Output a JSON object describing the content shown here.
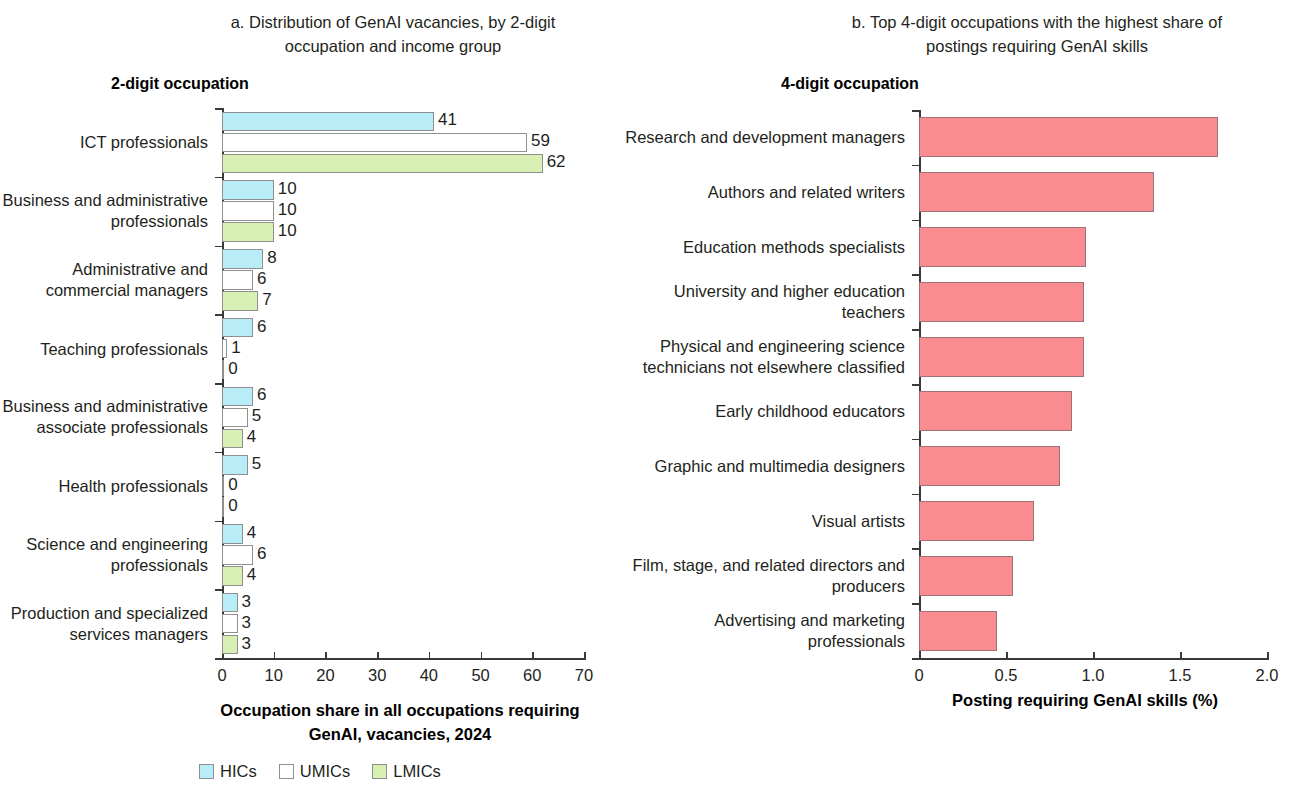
{
  "panel_a": {
    "title": "a. Distribution of GenAI vacancies, by 2-digit occupation and income group",
    "axis_header": "2-digit occupation",
    "xlabel": "Occupation share in all occupations requiring GenAI, vacancies, 2024",
    "legend": [
      {
        "key": "HICs",
        "label": "HICs",
        "color": "#b8ecf6"
      },
      {
        "key": "UMICs",
        "label": "UMICs",
        "color": "#ffffff"
      },
      {
        "key": "LMICs",
        "label": "LMICs",
        "color": "#d9f0b4"
      }
    ]
  },
  "panel_b": {
    "title": "b. Top 4-digit occupations with the highest share of postings requiring GenAI skills",
    "axis_header": "4-digit occupation",
    "xlabel": "Posting requiring GenAI skills (%)",
    "bar_color": "#fa8b91"
  },
  "chart_data": [
    {
      "type": "bar",
      "id": "panel-a",
      "orientation": "horizontal",
      "title": "a. Distribution of GenAI vacancies, by 2-digit occupation and income group",
      "xlabel": "Occupation share in all occupations requiring GenAI, vacancies, 2024",
      "ylabel": "2-digit occupation",
      "xlim": [
        0,
        70
      ],
      "xticks": [
        0,
        10,
        20,
        30,
        40,
        50,
        60,
        70
      ],
      "xticklabels": [
        "0",
        "10",
        "20",
        "30",
        "40",
        "50",
        "60",
        "70"
      ],
      "grid": false,
      "legend": [
        "HICs",
        "UMICs",
        "LMICs"
      ],
      "legend_position": "bottom",
      "categories": [
        "ICT professionals",
        "Business and administrative professionals",
        "Administrative and commercial managers",
        "Teaching professionals",
        "Business and administrative associate professionals",
        "Health professionals",
        "Science and engineering professionals",
        "Production and specialized services managers"
      ],
      "series": [
        {
          "name": "HICs",
          "color": "#b8ecf6",
          "values": [
            41,
            10,
            8,
            6,
            6,
            5,
            4,
            3
          ]
        },
        {
          "name": "UMICs",
          "color": "#ffffff",
          "values": [
            59,
            10,
            6,
            1,
            5,
            0,
            6,
            3
          ]
        },
        {
          "name": "LMICs",
          "color": "#d9f0b4",
          "values": [
            62,
            10,
            7,
            0,
            4,
            0,
            4,
            3
          ]
        }
      ]
    },
    {
      "type": "bar",
      "id": "panel-b",
      "orientation": "horizontal",
      "title": "b. Top 4-digit occupations with the highest share of postings requiring GenAI skills",
      "xlabel": "Posting requiring GenAI skills (%)",
      "ylabel": "4-digit occupation",
      "xlim": [
        0,
        2.0
      ],
      "xticks": [
        0,
        0.5,
        1.0,
        1.5,
        2.0
      ],
      "xticklabels": [
        "0",
        "0.5",
        "1.0",
        "1.5",
        "2.0"
      ],
      "grid": false,
      "categories": [
        "Research and development managers",
        "Authors and related writers",
        "Education methods specialists",
        "University and higher education teachers",
        "Physical and engineering science technicians not elsewhere classified",
        "Early childhood educators",
        "Graphic and multimedia designers",
        "Visual artists",
        "Film, stage, and related directors and producers",
        "Advertising and marketing professionals"
      ],
      "values": [
        1.72,
        1.35,
        0.96,
        0.95,
        0.95,
        0.88,
        0.81,
        0.66,
        0.54,
        0.45
      ],
      "color": "#fa8b91"
    }
  ]
}
